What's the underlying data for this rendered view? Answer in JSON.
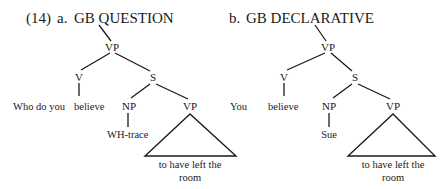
{
  "figure": {
    "example_number": "(14)",
    "trees": [
      {
        "id": "a",
        "label": "a.",
        "title": "GB QUESTION",
        "nodes": {
          "root": "VP",
          "v": "V",
          "s": "S",
          "np": "NP",
          "vp2": "VP"
        },
        "leaves": {
          "pre_verb": "Who do you",
          "verb": "believe",
          "np": "WH-trace",
          "vp2_line1": "to have left the",
          "vp2_line2": "room"
        }
      },
      {
        "id": "b",
        "label": "b.",
        "title": "GB DECLARATIVE",
        "nodes": {
          "root": "VP",
          "v": "V",
          "s": "S",
          "np": "NP",
          "vp2": "VP"
        },
        "leaves": {
          "pre_verb": "You",
          "verb": "believe",
          "np": "Sue",
          "vp2_line1": "to have left the",
          "vp2_line2": "room"
        }
      }
    ]
  }
}
